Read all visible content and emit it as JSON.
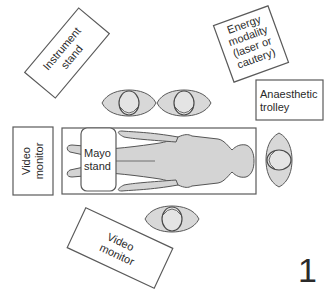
{
  "diagram": {
    "figure_number": "1",
    "labels": {
      "instrument_stand": [
        "Instrument",
        "stand"
      ],
      "energy_modality": [
        "Energy",
        "modality",
        "(laser or",
        "cautery)"
      ],
      "anaesthetic_trolley": [
        "Anaesthetic",
        "trolley"
      ],
      "video_monitor_left": [
        "Video",
        "monitor"
      ],
      "mayo_stand": [
        "Mayo",
        "stand"
      ],
      "video_monitor_bottom": [
        "Video",
        "monitor"
      ]
    },
    "staff_count": 4,
    "elements": [
      "Instrument stand",
      "Energy modality (laser or cautery)",
      "Anaesthetic trolley",
      "Video monitor",
      "Mayo stand",
      "Operating table with patient",
      "Video monitor"
    ]
  }
}
